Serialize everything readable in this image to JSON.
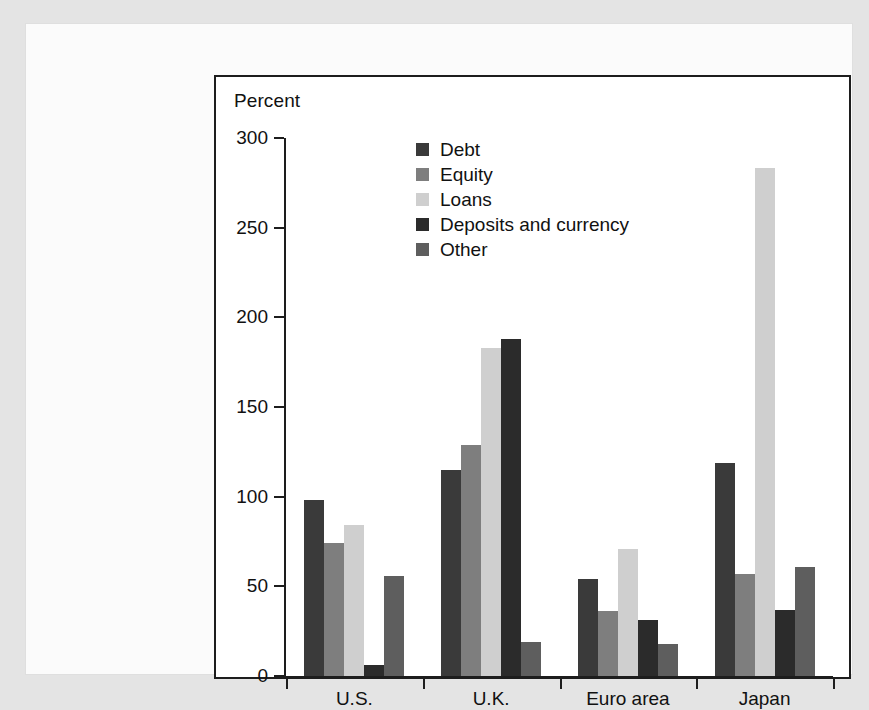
{
  "chart_data": {
    "type": "bar",
    "title": "",
    "axis_title": "Percent",
    "xlabel": "",
    "ylabel": "Percent",
    "ylim": [
      0,
      300
    ],
    "ytick_values": [
      0,
      50,
      100,
      150,
      200,
      250,
      300
    ],
    "ytick_labels": [
      "0",
      "50",
      "100",
      "150",
      "200",
      "250",
      "300"
    ],
    "grid": false,
    "legend_position": "upper-center-left",
    "categories": [
      "U.S.",
      "U.K.",
      "Euro area",
      "Japan"
    ],
    "series": [
      {
        "name": "Debt",
        "color": "#3a3a3a",
        "values": [
          98,
          115,
          54,
          119
        ]
      },
      {
        "name": "Equity",
        "color": "#7e7e7e",
        "values": [
          74,
          129,
          36,
          57
        ]
      },
      {
        "name": "Loans",
        "color": "#cfcfcf",
        "values": [
          84,
          183,
          71,
          283
        ]
      },
      {
        "name": "Deposits and currency",
        "color": "#2b2b2b",
        "values": [
          6,
          188,
          31,
          37
        ]
      },
      {
        "name": "Other",
        "color": "#5e5e5e",
        "values": [
          56,
          19,
          18,
          61
        ]
      }
    ]
  },
  "colors": {
    "page_background": "#e4e4e4",
    "sheet_background": "#fbfbfb",
    "chart_background": "#ffffff",
    "frame": "#1d1d1d",
    "text": "#111111"
  }
}
